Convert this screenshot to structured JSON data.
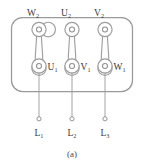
{
  "figure": {
    "caption": "(a)"
  },
  "terminal_block": {
    "links": [
      {
        "top_label": "W",
        "top_sub": "2",
        "bottom_label": "U",
        "bottom_sub": "1",
        "supply_label": "L",
        "supply_sub": "1"
      },
      {
        "top_label": "U",
        "top_sub": "2",
        "bottom_label": "V",
        "bottom_sub": "1",
        "supply_label": "L",
        "supply_sub": "2"
      },
      {
        "top_label": "V",
        "top_sub": "2",
        "bottom_label": "W",
        "bottom_sub": "1",
        "supply_label": "L",
        "supply_sub": "3"
      }
    ]
  },
  "colors": {
    "line": "#9a9a9a",
    "text": "#3a3a3a",
    "background": "#ffffff"
  }
}
